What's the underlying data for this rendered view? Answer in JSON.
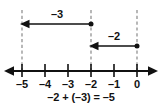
{
  "figure": {
    "background_color": "#ffffff",
    "line_color": "#111111",
    "dash_color": "#9a9a9a"
  },
  "number_line": {
    "axis_y": 71,
    "left_arrow_x": 6,
    "right_arrow_x": 156,
    "ticks": [
      {
        "value": "-5",
        "label": "–5",
        "x": 22
      },
      {
        "value": "-4",
        "label": "–4",
        "x": 45
      },
      {
        "value": "-3",
        "label": "–3",
        "x": 68
      },
      {
        "value": "-2",
        "label": "–2",
        "x": 91
      },
      {
        "value": "-1",
        "label": "–1",
        "x": 114
      },
      {
        "value": "0",
        "label": "0",
        "x": 137
      }
    ],
    "label_y": 76
  },
  "dashed_guides": [
    {
      "name": "guide-at-minus-5",
      "x": 22,
      "y1": 10,
      "y2": 71
    },
    {
      "name": "guide-at-minus-2",
      "x": 91,
      "y1": 10,
      "y2": 71
    },
    {
      "name": "guide-at-zero",
      "x": 137,
      "y1": 10,
      "y2": 71
    }
  ],
  "jumps": [
    {
      "name": "jump-minus-three",
      "label": "–3",
      "value": -3,
      "from_value": "-2",
      "to_value": "-5",
      "start_x": 91,
      "end_x": 22,
      "y": 24,
      "label_x": 44,
      "label_y": 8,
      "direction": "left"
    },
    {
      "name": "jump-minus-two",
      "label": "–2",
      "value": -2,
      "from_value": "0",
      "to_value": "-2",
      "start_x": 137,
      "end_x": 91,
      "y": 46,
      "label_x": 101,
      "label_y": 30,
      "direction": "left"
    }
  ],
  "equation": {
    "text": "–2 + (–3) = –5",
    "y": 91
  }
}
